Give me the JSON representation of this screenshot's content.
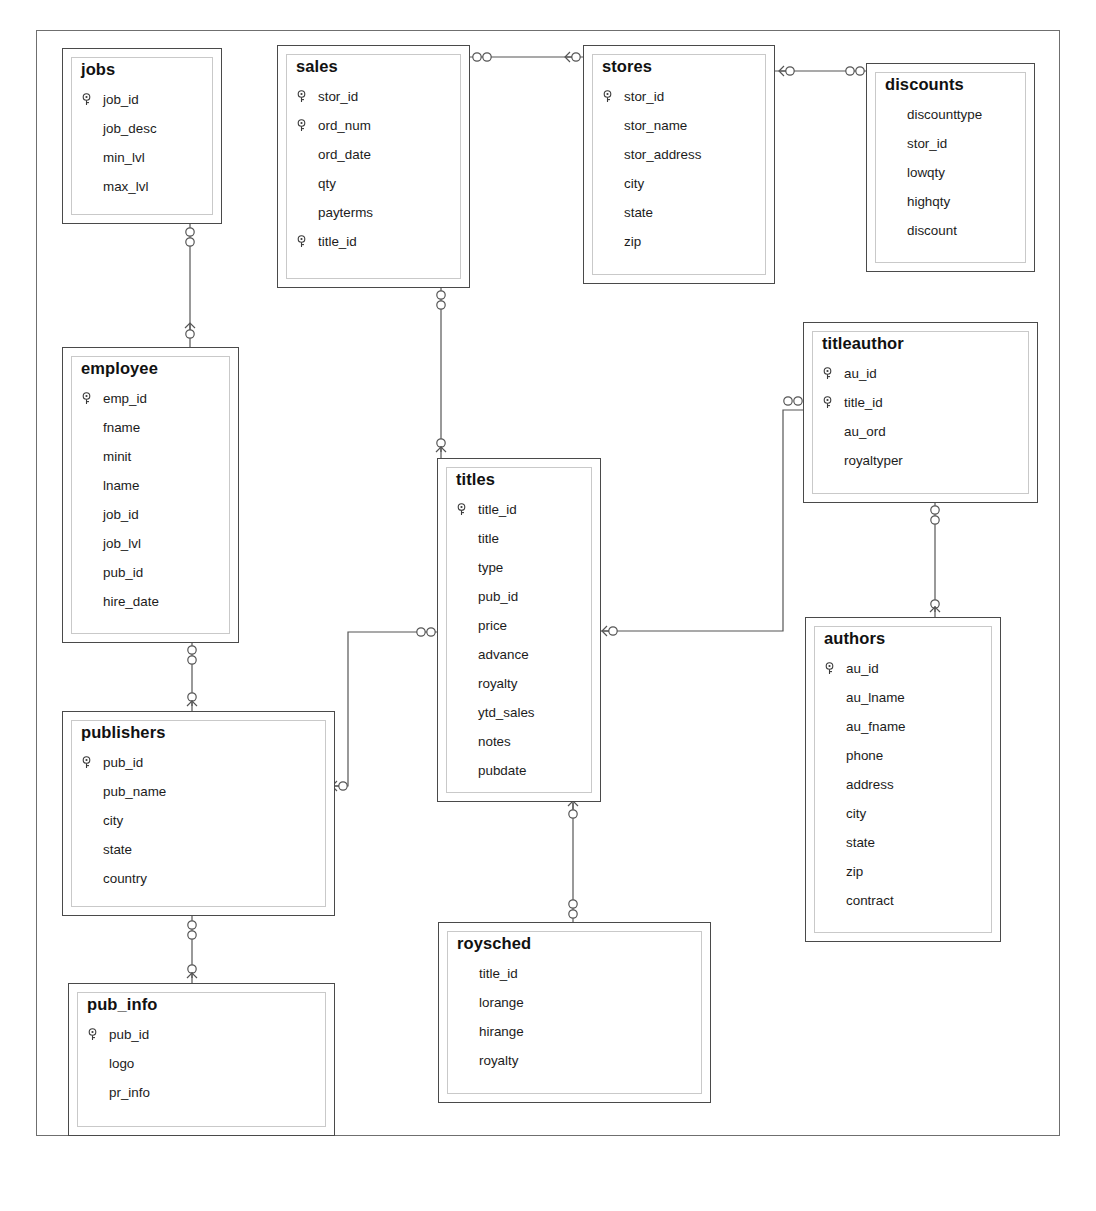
{
  "diagram": {
    "notation": "crows-foot",
    "entity_count": 11
  },
  "entities": [
    {
      "id": "jobs",
      "name": "jobs",
      "x": 62,
      "y": 48,
      "w": 160,
      "h": 176,
      "fields": [
        {
          "name": "job_id",
          "key": true
        },
        {
          "name": "job_desc",
          "key": false
        },
        {
          "name": "min_lvl",
          "key": false
        },
        {
          "name": "max_lvl",
          "key": false
        }
      ]
    },
    {
      "id": "sales",
      "name": "sales",
      "x": 277,
      "y": 45,
      "w": 193,
      "h": 243,
      "fields": [
        {
          "name": "stor_id",
          "key": true
        },
        {
          "name": "ord_num",
          "key": true
        },
        {
          "name": "ord_date",
          "key": false
        },
        {
          "name": "qty",
          "key": false
        },
        {
          "name": "payterms",
          "key": false
        },
        {
          "name": "title_id",
          "key": true
        }
      ]
    },
    {
      "id": "stores",
      "name": "stores",
      "x": 583,
      "y": 45,
      "w": 192,
      "h": 239,
      "fields": [
        {
          "name": "stor_id",
          "key": true
        },
        {
          "name": "stor_name",
          "key": false
        },
        {
          "name": "stor_address",
          "key": false
        },
        {
          "name": "city",
          "key": false
        },
        {
          "name": "state",
          "key": false
        },
        {
          "name": "zip",
          "key": false
        }
      ]
    },
    {
      "id": "discounts",
      "name": "discounts",
      "x": 866,
      "y": 63,
      "w": 169,
      "h": 209,
      "fields": [
        {
          "name": "discounttype",
          "key": false
        },
        {
          "name": "stor_id",
          "key": false
        },
        {
          "name": "lowqty",
          "key": false
        },
        {
          "name": "highqty",
          "key": false
        },
        {
          "name": "discount",
          "key": false
        }
      ]
    },
    {
      "id": "employee",
      "name": "employee",
      "x": 62,
      "y": 347,
      "w": 177,
      "h": 296,
      "fields": [
        {
          "name": "emp_id",
          "key": true
        },
        {
          "name": "fname",
          "key": false
        },
        {
          "name": "minit",
          "key": false
        },
        {
          "name": "lname",
          "key": false
        },
        {
          "name": "job_id",
          "key": false
        },
        {
          "name": "job_lvl",
          "key": false
        },
        {
          "name": "pub_id",
          "key": false
        },
        {
          "name": "hire_date",
          "key": false
        }
      ]
    },
    {
      "id": "titleauthor",
      "name": "titleauthor",
      "x": 803,
      "y": 322,
      "w": 235,
      "h": 181,
      "fields": [
        {
          "name": "au_id",
          "key": true
        },
        {
          "name": "title_id",
          "key": true
        },
        {
          "name": "au_ord",
          "key": false
        },
        {
          "name": "royaltyper",
          "key": false
        }
      ]
    },
    {
      "id": "titles",
      "name": "titles",
      "x": 437,
      "y": 458,
      "w": 164,
      "h": 344,
      "fields": [
        {
          "name": "title_id",
          "key": true
        },
        {
          "name": "title",
          "key": false
        },
        {
          "name": "type",
          "key": false
        },
        {
          "name": "pub_id",
          "key": false
        },
        {
          "name": "price",
          "key": false
        },
        {
          "name": "advance",
          "key": false
        },
        {
          "name": "royalty",
          "key": false
        },
        {
          "name": "ytd_sales",
          "key": false
        },
        {
          "name": "notes",
          "key": false
        },
        {
          "name": "pubdate",
          "key": false
        }
      ]
    },
    {
      "id": "authors",
      "name": "authors",
      "x": 805,
      "y": 617,
      "w": 196,
      "h": 325,
      "fields": [
        {
          "name": "au_id",
          "key": true
        },
        {
          "name": "au_lname",
          "key": false
        },
        {
          "name": "au_fname",
          "key": false
        },
        {
          "name": "phone",
          "key": false
        },
        {
          "name": "address",
          "key": false
        },
        {
          "name": "city",
          "key": false
        },
        {
          "name": "state",
          "key": false
        },
        {
          "name": "zip",
          "key": false
        },
        {
          "name": "contract",
          "key": false
        }
      ]
    },
    {
      "id": "publishers",
      "name": "publishers",
      "x": 62,
      "y": 711,
      "w": 273,
      "h": 205,
      "fields": [
        {
          "name": "pub_id",
          "key": true
        },
        {
          "name": "pub_name",
          "key": false
        },
        {
          "name": "city",
          "key": false
        },
        {
          "name": "state",
          "key": false
        },
        {
          "name": "country",
          "key": false
        }
      ]
    },
    {
      "id": "roysched",
      "name": "roysched",
      "x": 438,
      "y": 922,
      "w": 273,
      "h": 181,
      "fields": [
        {
          "name": "title_id",
          "key": false
        },
        {
          "name": "lorange",
          "key": false
        },
        {
          "name": "hirange",
          "key": false
        },
        {
          "name": "royalty",
          "key": false
        }
      ]
    },
    {
      "id": "pub_info",
      "name": "pub_info",
      "x": 68,
      "y": 983,
      "w": 267,
      "h": 153,
      "fields": [
        {
          "name": "pub_id",
          "key": true
        },
        {
          "name": "logo",
          "key": false
        },
        {
          "name": "pr_info",
          "key": false
        }
      ]
    }
  ],
  "relationships": [
    {
      "id": "sales-stores",
      "from": "sales",
      "to": "stores",
      "from_card": "many",
      "to_card": "one"
    },
    {
      "id": "stores-discounts",
      "from": "stores",
      "to": "discounts",
      "from_card": "one",
      "to_card": "many"
    },
    {
      "id": "jobs-employee",
      "from": "jobs",
      "to": "employee",
      "from_card": "many",
      "to_card": "one"
    },
    {
      "id": "sales-titles",
      "from": "sales",
      "to": "titles",
      "from_card": "many",
      "to_card": "one"
    },
    {
      "id": "publishers-titles",
      "from": "publishers",
      "to": "titles",
      "from_card": "one",
      "to_card": "many"
    },
    {
      "id": "titles-titleauthor",
      "from": "titles",
      "to": "titleauthor",
      "from_card": "one",
      "to_card": "many"
    },
    {
      "id": "titleauthor-authors",
      "from": "titleauthor",
      "to": "authors",
      "from_card": "many",
      "to_card": "one"
    },
    {
      "id": "titles-roysched",
      "from": "titles",
      "to": "roysched",
      "from_card": "one",
      "to_card": "many"
    },
    {
      "id": "employee-publishers",
      "from": "employee",
      "to": "publishers",
      "from_card": "many",
      "to_card": "one"
    },
    {
      "id": "publishers-pub_info",
      "from": "publishers",
      "to": "pub_info",
      "from_card": "many",
      "to_card": "one"
    }
  ],
  "colors": {
    "background": "#ffffff",
    "frame_border": "#6f6f6f",
    "entity_border": "#4a4a4a",
    "entity_inner_border": "#c9c9c9",
    "text": "#1c1c1c",
    "connector": "#555555"
  }
}
